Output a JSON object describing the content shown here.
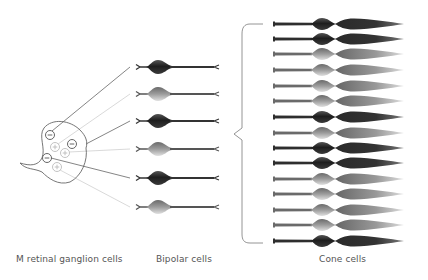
{
  "labels": {
    "ganglion": "M retinal ganglion cells",
    "bipolar": "Bipolar cells",
    "cone": "Cone cells"
  },
  "colors": {
    "dark": "#2a2a2a",
    "light": "#9a9a9a",
    "outline": "#666666",
    "line_dark": "#666666",
    "line_light": "#c8c8c8",
    "brace": "#888888",
    "label": "#555555"
  },
  "ganglion_symbols": [
    {
      "sign": "minus",
      "x": 50,
      "y": 135,
      "shade": "dark"
    },
    {
      "sign": "plus",
      "x": 55,
      "y": 147,
      "shade": "light"
    },
    {
      "sign": "minus",
      "x": 72,
      "y": 144,
      "shade": "dark"
    },
    {
      "sign": "plus",
      "x": 65,
      "y": 153,
      "shade": "light"
    },
    {
      "sign": "minus",
      "x": 47,
      "y": 158,
      "shade": "dark"
    },
    {
      "sign": "plus",
      "x": 57,
      "y": 167,
      "shade": "light"
    }
  ],
  "bipolar_cells": [
    {
      "y": 67,
      "shade": "dark"
    },
    {
      "y": 94,
      "shade": "light"
    },
    {
      "y": 121,
      "shade": "dark"
    },
    {
      "y": 149,
      "shade": "light"
    },
    {
      "y": 178,
      "shade": "dark"
    },
    {
      "y": 207,
      "shade": "light"
    }
  ],
  "cone_cells": [
    {
      "y": 24,
      "shade": "dark"
    },
    {
      "y": 39,
      "shade": "dark"
    },
    {
      "y": 54,
      "shade": "light"
    },
    {
      "y": 70,
      "shade": "light"
    },
    {
      "y": 86,
      "shade": "light"
    },
    {
      "y": 101,
      "shade": "light"
    },
    {
      "y": 117,
      "shade": "dark"
    },
    {
      "y": 133,
      "shade": "light"
    },
    {
      "y": 148,
      "shade": "dark"
    },
    {
      "y": 163,
      "shade": "dark"
    },
    {
      "y": 179,
      "shade": "light"
    },
    {
      "y": 194,
      "shade": "light"
    },
    {
      "y": 210,
      "shade": "light"
    },
    {
      "y": 225,
      "shade": "light"
    },
    {
      "y": 241,
      "shade": "dark"
    }
  ]
}
